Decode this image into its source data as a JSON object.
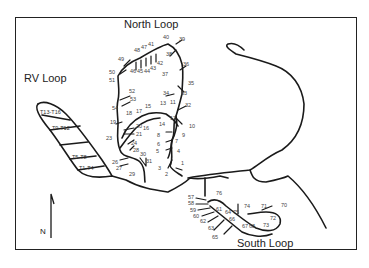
{
  "map": {
    "regions": [
      {
        "id": "north-loop",
        "label": "North Loop",
        "x": 124,
        "y": 19
      },
      {
        "id": "rv-loop",
        "label": "RV Loop",
        "x": 24,
        "y": 73
      },
      {
        "id": "south-loop",
        "label": "South Loop",
        "x": 237,
        "y": 238
      }
    ],
    "tent_areas": [
      {
        "label": "T13-T16",
        "x": 40,
        "y": 110
      },
      {
        "label": "T9-T12",
        "x": 52,
        "y": 126
      },
      {
        "label": "T5-T8",
        "x": 72,
        "y": 155
      },
      {
        "label": "T1-T4",
        "x": 79,
        "y": 166
      }
    ],
    "north_arrow": {
      "label": "N"
    },
    "sites": [
      {
        "n": "1",
        "x": 181,
        "y": 161
      },
      {
        "n": "2",
        "x": 165,
        "y": 172
      },
      {
        "n": "3",
        "x": 158,
        "y": 166
      },
      {
        "n": "4",
        "x": 177,
        "y": 149
      },
      {
        "n": "5",
        "x": 156,
        "y": 149
      },
      {
        "n": "6",
        "x": 157,
        "y": 142
      },
      {
        "n": "7",
        "x": 175,
        "y": 139
      },
      {
        "n": "8",
        "x": 157,
        "y": 133
      },
      {
        "n": "9",
        "x": 182,
        "y": 133
      },
      {
        "n": "10",
        "x": 189,
        "y": 124
      },
      {
        "n": "11",
        "x": 170,
        "y": 100
      },
      {
        "n": "12",
        "x": 170,
        "y": 116
      },
      {
        "n": "13",
        "x": 160,
        "y": 101
      },
      {
        "n": "14",
        "x": 159,
        "y": 122
      },
      {
        "n": "15",
        "x": 145,
        "y": 104
      },
      {
        "n": "16",
        "x": 143,
        "y": 126
      },
      {
        "n": "17",
        "x": 136,
        "y": 109
      },
      {
        "n": "18",
        "x": 126,
        "y": 111
      },
      {
        "n": "19",
        "x": 110,
        "y": 120
      },
      {
        "n": "20",
        "x": 136,
        "y": 124
      },
      {
        "n": "21",
        "x": 136,
        "y": 132
      },
      {
        "n": "23",
        "x": 106,
        "y": 136
      },
      {
        "n": "24",
        "x": 131,
        "y": 141
      },
      {
        "n": "26",
        "x": 112,
        "y": 160
      },
      {
        "n": "27",
        "x": 116,
        "y": 166
      },
      {
        "n": "28",
        "x": 133,
        "y": 148
      },
      {
        "n": "29",
        "x": 129,
        "y": 172
      },
      {
        "n": "30",
        "x": 140,
        "y": 152
      },
      {
        "n": "31",
        "x": 146,
        "y": 159
      },
      {
        "n": "32",
        "x": 185,
        "y": 103
      },
      {
        "n": "33",
        "x": 181,
        "y": 91
      },
      {
        "n": "34",
        "x": 163,
        "y": 91
      },
      {
        "n": "35",
        "x": 188,
        "y": 81
      },
      {
        "n": "36",
        "x": 183,
        "y": 62
      },
      {
        "n": "37",
        "x": 162,
        "y": 72
      },
      {
        "n": "38",
        "x": 166,
        "y": 52
      },
      {
        "n": "39",
        "x": 179,
        "y": 37
      },
      {
        "n": "40",
        "x": 163,
        "y": 35
      },
      {
        "n": "41",
        "x": 148,
        "y": 42
      },
      {
        "n": "42",
        "x": 157,
        "y": 61
      },
      {
        "n": "43",
        "x": 150,
        "y": 66
      },
      {
        "n": "44",
        "x": 144,
        "y": 69
      },
      {
        "n": "45",
        "x": 137,
        "y": 69
      },
      {
        "n": "46",
        "x": 130,
        "y": 69
      },
      {
        "n": "47",
        "x": 141,
        "y": 45
      },
      {
        "n": "48",
        "x": 134,
        "y": 48
      },
      {
        "n": "49",
        "x": 118,
        "y": 57
      },
      {
        "n": "50",
        "x": 109,
        "y": 70
      },
      {
        "n": "51",
        "x": 109,
        "y": 78
      },
      {
        "n": "52",
        "x": 129,
        "y": 89
      },
      {
        "n": "53",
        "x": 130,
        "y": 97
      },
      {
        "n": "54",
        "x": 112,
        "y": 106
      },
      {
        "n": "57",
        "x": 188,
        "y": 195
      },
      {
        "n": "58",
        "x": 188,
        "y": 201
      },
      {
        "n": "59",
        "x": 190,
        "y": 208
      },
      {
        "n": "60",
        "x": 193,
        "y": 214
      },
      {
        "n": "61",
        "x": 216,
        "y": 207
      },
      {
        "n": "62",
        "x": 200,
        "y": 219
      },
      {
        "n": "63",
        "x": 208,
        "y": 226
      },
      {
        "n": "64",
        "x": 225,
        "y": 210
      },
      {
        "n": "65",
        "x": 212,
        "y": 235
      },
      {
        "n": "66",
        "x": 229,
        "y": 217
      },
      {
        "n": "67",
        "x": 242,
        "y": 224
      },
      {
        "n": "68",
        "x": 249,
        "y": 224
      },
      {
        "n": "70",
        "x": 281,
        "y": 203
      },
      {
        "n": "71",
        "x": 261,
        "y": 204
      },
      {
        "n": "72",
        "x": 270,
        "y": 216
      },
      {
        "n": "73",
        "x": 263,
        "y": 223
      },
      {
        "n": "74",
        "x": 244,
        "y": 204
      },
      {
        "n": "75",
        "x": 233,
        "y": 210
      },
      {
        "n": "76",
        "x": 216,
        "y": 191
      }
    ]
  }
}
